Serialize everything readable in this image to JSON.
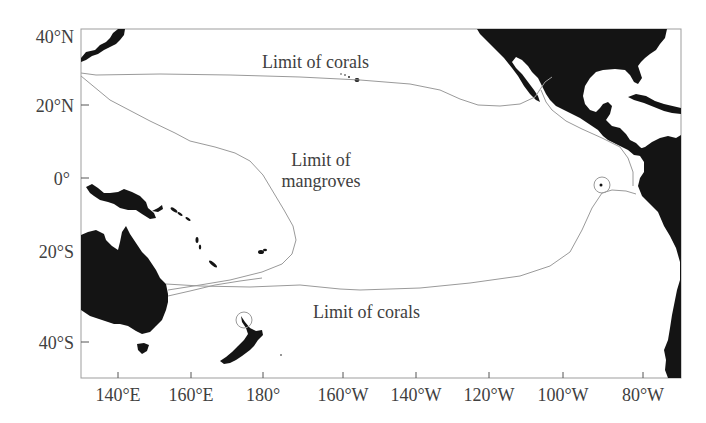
{
  "map": {
    "projection": "Mercator",
    "extent": {
      "lon_min": "130°E",
      "lon_max": "75°W",
      "lat_min": "48°S",
      "lat_max": "40°N"
    },
    "colors": {
      "land": "#111111",
      "ocean": "#ffffff",
      "frame": "#999999",
      "limit_lines": "#9a9a9a",
      "text": "#404040"
    },
    "y_axis": {
      "ticks": [
        {
          "label": "40°N",
          "y": 35
        },
        {
          "label": "20°N",
          "y": 105
        },
        {
          "label": "0°",
          "y": 178
        },
        {
          "label": "20°S",
          "y": 251
        },
        {
          "label": "40°S",
          "y": 342
        }
      ]
    },
    "x_axis": {
      "ticks": [
        {
          "label": "140°E",
          "x": 118
        },
        {
          "label": "160°E",
          "x": 191
        },
        {
          "label": "180°",
          "x": 263
        },
        {
          "label": "160°W",
          "x": 343
        },
        {
          "label": "140°W",
          "x": 416
        },
        {
          "label": "120°W",
          "x": 489
        },
        {
          "label": "100°W",
          "x": 563
        },
        {
          "label": "80°W",
          "x": 643
        }
      ]
    },
    "annotations": {
      "north_coral_limit": "Limit of corals",
      "mangrove_limit_line1": "Limit of",
      "mangrove_limit_line2": "mangroves",
      "south_coral_limit": "Limit of corals"
    },
    "markers": [
      {
        "name": "galapagos-circle",
        "label": ""
      },
      {
        "name": "new-zealand-north-circle",
        "label": ""
      }
    ]
  }
}
